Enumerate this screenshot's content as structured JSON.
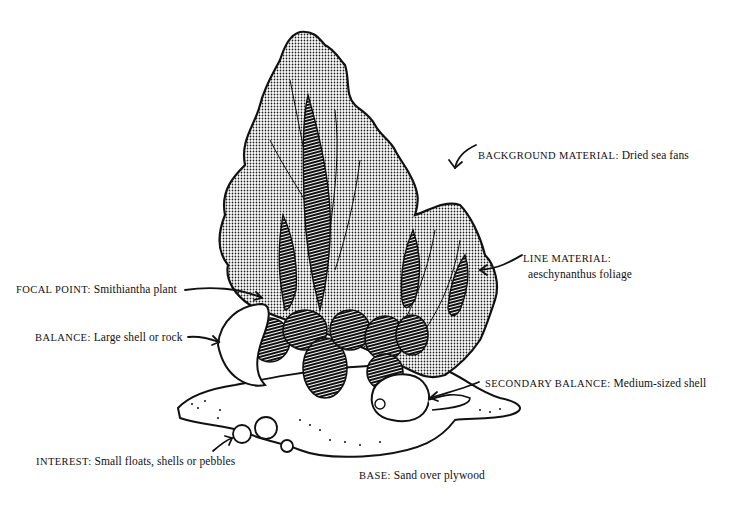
{
  "diagram": {
    "type": "labeled-illustration",
    "labels": [
      {
        "id": "background",
        "heading": "BACKGROUND MATERIAL:",
        "text": " Dried sea fans"
      },
      {
        "id": "line",
        "heading": "LINE MATERIAL:",
        "text": "aeschynanthus foliage"
      },
      {
        "id": "focal",
        "heading": "FOCAL POINT:",
        "text": " Smithiantha plant"
      },
      {
        "id": "balance",
        "heading": "BALANCE:",
        "text": " Large shell or rock"
      },
      {
        "id": "secondary",
        "heading": "SECONDARY BALANCE:",
        "text": " Medium-sized shell"
      },
      {
        "id": "interest",
        "heading": "INTEREST:",
        "text": " Small floats, shells or pebbles"
      },
      {
        "id": "base",
        "heading": "BASE:",
        "text": " Sand over plywood"
      }
    ]
  },
  "colors": {
    "ink": "#111111",
    "paper": "#ffffff"
  }
}
